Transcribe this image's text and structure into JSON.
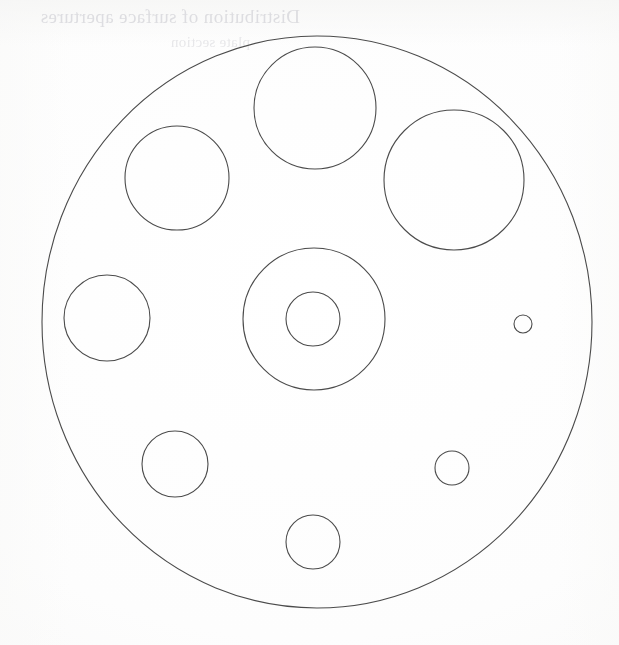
{
  "page": {
    "width": 619,
    "height": 645,
    "background_color": "#fefefe",
    "media": "scanned paper sheet"
  },
  "bleed_through": {
    "description": "faint mirrored show-through text from the reverse side of the scanned sheet",
    "color": "#d9d9dd",
    "line_1": "Distribution of surface apertures",
    "line_2": "plate section"
  },
  "diagram": {
    "stroke_color": "#4b4b4b",
    "stroke_width": 1.1,
    "fill": "none",
    "outer_boundary": {
      "label": "outer-plate-boundary",
      "cx": 317,
      "cy": 322,
      "rx": 275,
      "ry": 286
    },
    "hub": {
      "label": "central-hub",
      "outer": {
        "cx": 314,
        "cy": 319,
        "r": 71
      },
      "inner": {
        "cx": 313,
        "cy": 319,
        "r": 27
      }
    },
    "apertures": [
      {
        "id": "aperture-top",
        "label": "top aperture",
        "cx": 315,
        "cy": 108,
        "r": 61
      },
      {
        "id": "aperture-upper-left",
        "label": "upper-left aperture",
        "cx": 177,
        "cy": 178,
        "r": 52
      },
      {
        "id": "aperture-upper-right",
        "label": "upper-right aperture",
        "cx": 454,
        "cy": 180,
        "r": 70
      },
      {
        "id": "aperture-left",
        "label": "left aperture",
        "cx": 107,
        "cy": 318,
        "r": 43
      },
      {
        "id": "aperture-lower-left",
        "label": "lower-left aperture",
        "cx": 175,
        "cy": 464,
        "r": 33
      },
      {
        "id": "aperture-bottom",
        "label": "bottom aperture",
        "cx": 313,
        "cy": 542,
        "r": 27
      },
      {
        "id": "aperture-lower-right",
        "label": "lower-right aperture",
        "cx": 452,
        "cy": 468,
        "r": 17
      },
      {
        "id": "aperture-right-small",
        "label": "right small aperture",
        "cx": 523,
        "cy": 324,
        "r": 9
      }
    ]
  },
  "chart_data": {
    "type": "scatter",
    "subtitle": "",
    "xlabel": "",
    "ylabel": "",
    "xlim": [
      0,
      619
    ],
    "ylim": [
      0,
      645
    ],
    "grid": false,
    "legend": "none",
    "annotations": [],
    "units": "pixels (image coordinates, y increases downward)",
    "series": [
      {
        "name": "outer boundary",
        "shape": "ellipse",
        "points": [
          {
            "x": 317,
            "y": 322,
            "rx": 275,
            "ry": 286
          }
        ]
      },
      {
        "name": "central hub rings",
        "shape": "circle",
        "points": [
          {
            "x": 314,
            "y": 319,
            "r": 71
          },
          {
            "x": 313,
            "y": 319,
            "r": 27
          }
        ]
      },
      {
        "name": "apertures",
        "shape": "circle",
        "points": [
          {
            "x": 315,
            "y": 108,
            "r": 61
          },
          {
            "x": 177,
            "y": 178,
            "r": 52
          },
          {
            "x": 454,
            "y": 180,
            "r": 70
          },
          {
            "x": 107,
            "y": 318,
            "r": 43
          },
          {
            "x": 175,
            "y": 464,
            "r": 33
          },
          {
            "x": 313,
            "y": 542,
            "r": 27
          },
          {
            "x": 452,
            "y": 468,
            "r": 17
          },
          {
            "x": 523,
            "y": 324,
            "r": 9
          }
        ]
      }
    ]
  }
}
